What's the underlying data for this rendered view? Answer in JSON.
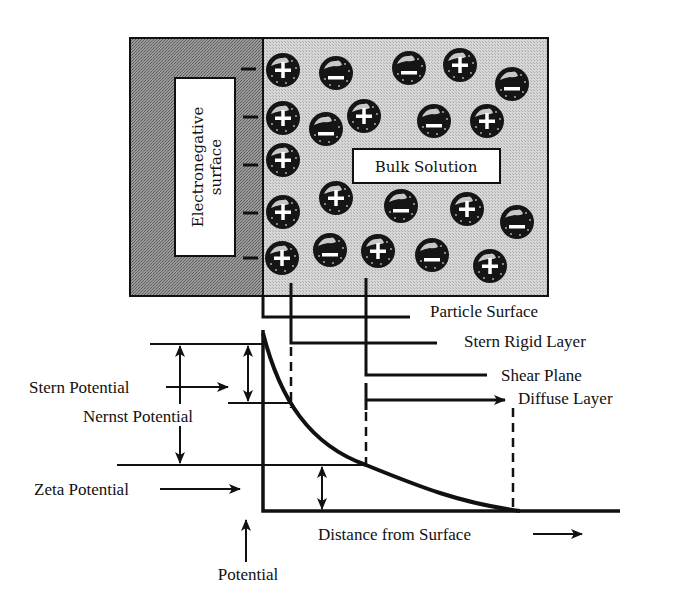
{
  "diagram": {
    "colors": {
      "ink": "#111111",
      "surface_fill": "#8c8c8c",
      "solution_fill": "#cfcfcf",
      "label_box_fill": "#ffffff",
      "ion_fill": "#151515",
      "ion_sign": "#ffffff"
    },
    "frame": {
      "surface_label": "Electronegative surface",
      "surface_label_line1": "Electronegative",
      "surface_label_line2": "surface",
      "bulk_label": "Bulk Solution",
      "surface_charges": [
        "−",
        "−",
        "−",
        "−",
        "−"
      ]
    },
    "ions": [
      {
        "x": 283,
        "y": 70,
        "sign": "+"
      },
      {
        "x": 336,
        "y": 73,
        "sign": "−"
      },
      {
        "x": 409,
        "y": 68,
        "sign": "−"
      },
      {
        "x": 460,
        "y": 65,
        "sign": "+"
      },
      {
        "x": 512,
        "y": 84,
        "sign": "−"
      },
      {
        "x": 283,
        "y": 118,
        "sign": "+"
      },
      {
        "x": 326,
        "y": 129,
        "sign": "−"
      },
      {
        "x": 364,
        "y": 116,
        "sign": "+"
      },
      {
        "x": 434,
        "y": 121,
        "sign": "−"
      },
      {
        "x": 487,
        "y": 121,
        "sign": "+"
      },
      {
        "x": 283,
        "y": 160,
        "sign": "+"
      },
      {
        "x": 283,
        "y": 212,
        "sign": "+"
      },
      {
        "x": 336,
        "y": 198,
        "sign": "+"
      },
      {
        "x": 401,
        "y": 206,
        "sign": "−"
      },
      {
        "x": 467,
        "y": 209,
        "sign": "+"
      },
      {
        "x": 517,
        "y": 222,
        "sign": "−"
      },
      {
        "x": 282,
        "y": 258,
        "sign": "+"
      },
      {
        "x": 330,
        "y": 250,
        "sign": "−"
      },
      {
        "x": 378,
        "y": 251,
        "sign": "+"
      },
      {
        "x": 432,
        "y": 255,
        "sign": "−"
      },
      {
        "x": 490,
        "y": 266,
        "sign": "+"
      }
    ],
    "layer_labels": {
      "particle_surface": "Particle Surface",
      "stern_rigid_layer": "Stern Rigid Layer",
      "shear_plane": "Shear Plane",
      "diffuse_layer": "Diffuse Layer"
    },
    "potential_labels": {
      "stern_potential": "Stern Potential",
      "nernst_potential": "Nernst Potential",
      "zeta_potential": "Zeta Potential"
    },
    "axes": {
      "y_label": "Potential",
      "x_label": "Distance from Surface"
    }
  }
}
